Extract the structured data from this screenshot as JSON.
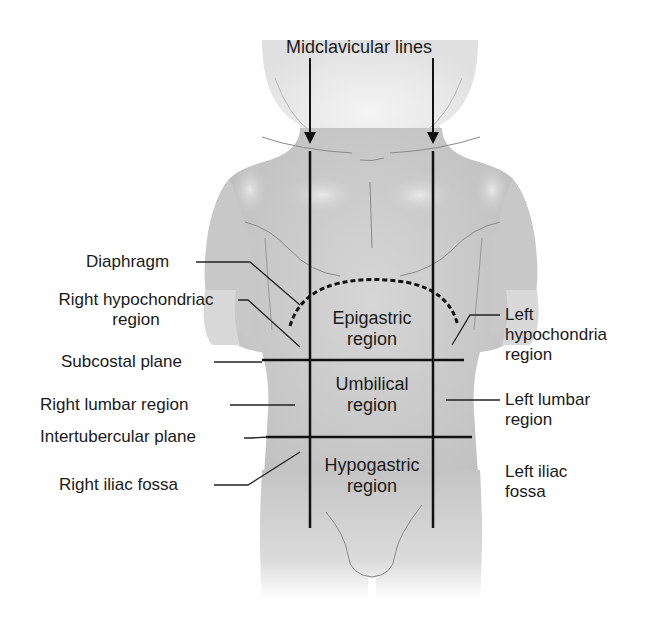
{
  "title": "Midclavicular lines",
  "colors": {
    "background": "#ffffff",
    "skin_light": "#e6e6e6",
    "skin_mid": "#c9c9c9",
    "skin_dark": "#a9a9a9",
    "lines": "#111111",
    "text": "#1a1a1a"
  },
  "left_labels": {
    "diaphragm": "Diaphragm",
    "right_hypochondriac_1": "Right hypochondriac",
    "right_hypochondriac_2": "region",
    "subcostal_plane": "Subcostal plane",
    "right_lumbar": "Right lumbar region",
    "intertubercular_plane": "Intertubercular plane",
    "right_iliac": "Right iliac fossa"
  },
  "right_labels": {
    "left_hypochondria_1": "Left",
    "left_hypochondria_2": "hypochondria",
    "left_hypochondria_3": "region",
    "left_lumbar_1": "Left lumbar",
    "left_lumbar_2": "region",
    "left_iliac_1": "Left iliac",
    "left_iliac_2": "fossa"
  },
  "regions": {
    "epigastric_1": "Epigastric",
    "epigastric_2": "region",
    "umbilical_1": "Umbilical",
    "umbilical_2": "region",
    "hypogastric_1": "Hypogastric",
    "hypogastric_2": "region"
  }
}
